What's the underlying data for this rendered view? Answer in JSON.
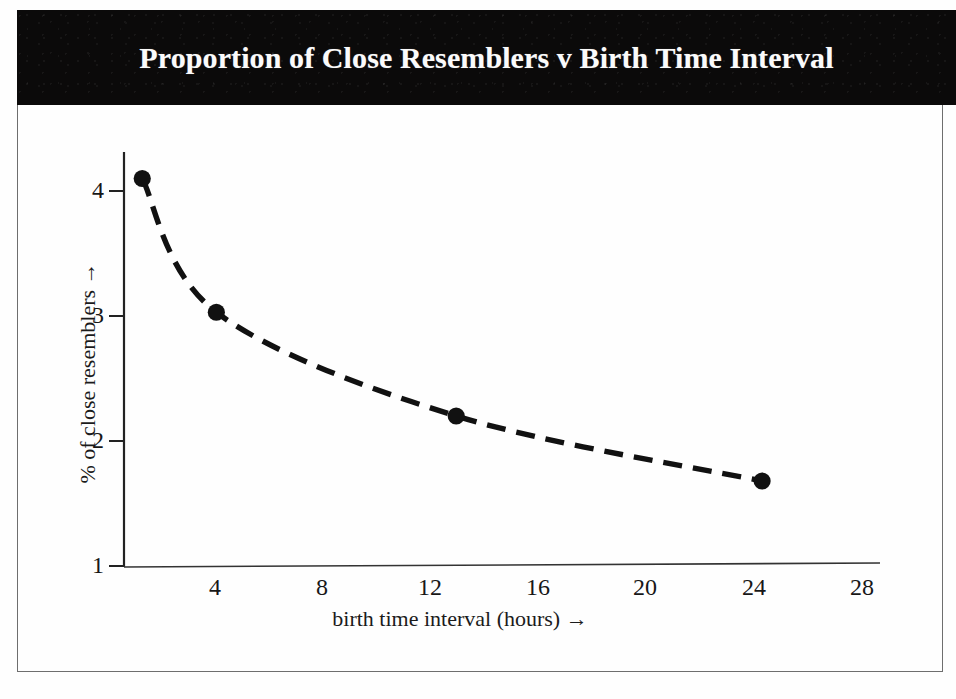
{
  "figure": {
    "title": "Proportion of Close Resemblers v Birth Time Interval",
    "title_band_color": "#0b0a0a",
    "title_text_color": "#fbfbfb",
    "frame_color": "#6e6e6e",
    "background_color": "#fefefe",
    "ink_color": "#111111"
  },
  "chart_data": {
    "type": "line",
    "title": "Proportion of Close Resemblers v Birth Time Interval",
    "xlabel": "birth time interval (hours) →",
    "ylabel": "% of close resemblers →",
    "xlim": [
      0,
      30
    ],
    "ylim": [
      1,
      4.3
    ],
    "xticks": [
      4,
      8,
      12,
      16,
      20,
      24,
      28
    ],
    "xtick_labels": [
      "4",
      "8",
      "12",
      "16",
      "20",
      "24",
      "28"
    ],
    "yticks": [
      1,
      2,
      3,
      4
    ],
    "ytick_labels": [
      "1",
      "2",
      "3",
      "4"
    ],
    "grid": false,
    "legend": null,
    "line_style": "dashed",
    "marker": "filled-circle",
    "series": [
      {
        "name": "% of close resemblers",
        "x": [
          1.3,
          4.05,
          12.95,
          24.3
        ],
        "y": [
          4.1,
          3.03,
          2.2,
          1.68
        ]
      }
    ]
  }
}
